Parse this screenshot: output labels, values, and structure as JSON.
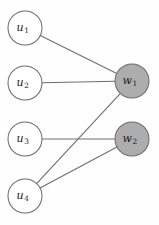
{
  "figure": {
    "name": "bipartite-graph",
    "background_color": "#fefefe",
    "width": 159,
    "height": 225
  },
  "style": {
    "left_node_fill": "#ffffff",
    "right_node_fill": "#adadad",
    "node_stroke": "#6b6b6b",
    "edge_color": "#6e6e6e",
    "label_color": "#1b1b1b",
    "node_radius": 17,
    "edge_width": 1.1
  },
  "chart_data": {
    "type": "diagram",
    "subtype": "bipartite-graph",
    "title": "",
    "nodes": [
      {
        "id": "u1",
        "base": "u",
        "sub": "1",
        "x": 25,
        "y": 28,
        "group": "left",
        "fill": "#ffffff"
      },
      {
        "id": "u2",
        "base": "u",
        "sub": "2",
        "x": 25,
        "y": 83,
        "group": "left",
        "fill": "#ffffff"
      },
      {
        "id": "u3",
        "base": "u",
        "sub": "3",
        "x": 25,
        "y": 139,
        "group": "left",
        "fill": "#ffffff"
      },
      {
        "id": "u4",
        "base": "u",
        "sub": "4",
        "x": 25,
        "y": 196,
        "group": "left",
        "fill": "#ffffff"
      },
      {
        "id": "w1",
        "base": "w",
        "sub": "1",
        "x": 132,
        "y": 81,
        "group": "right",
        "fill": "#adadad"
      },
      {
        "id": "w2",
        "base": "w",
        "sub": "2",
        "x": 132,
        "y": 139,
        "group": "right",
        "fill": "#adadad"
      }
    ],
    "edges": [
      {
        "from": "u1",
        "to": "w1"
      },
      {
        "from": "u2",
        "to": "w1"
      },
      {
        "from": "u4",
        "to": "w1"
      },
      {
        "from": "u3",
        "to": "w2"
      },
      {
        "from": "u4",
        "to": "w2"
      }
    ],
    "legend": [],
    "annotations": []
  }
}
